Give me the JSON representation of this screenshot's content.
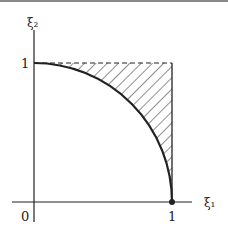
{
  "diagram": {
    "axis_labels": {
      "x": "ξ₁",
      "y": "ξ₂"
    },
    "tick_labels": {
      "origin": "0",
      "x_one": "1",
      "y_one": "1"
    },
    "colors": {
      "ink": "#222222",
      "background": "#ffffff",
      "top_border": "#8a8a8a"
    }
  }
}
